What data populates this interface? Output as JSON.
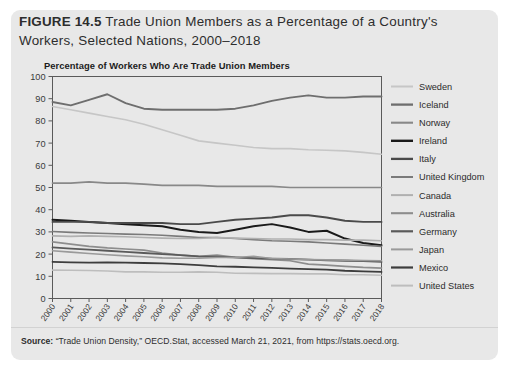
{
  "figure": {
    "number": "FIGURE 14.5",
    "title": "Trade Union Members as a Percentage of a Country's Workers, Selected Nations, 2000–2018",
    "subtitle": "Percentage of Workers Who Are Trade Union Members",
    "source_label": "Source:",
    "source_text": " “Trade Union Density,” OECD.Stat, accessed March 21, 2021, from https://stats.oecd.org.",
    "panel_color": "#e8e8e8",
    "page_color": "#ffffff"
  },
  "chart_data": {
    "type": "line",
    "title": "Percentage of Workers Who Are Trade Union Members",
    "xlabel": "",
    "ylabel": "",
    "ylim": [
      0,
      100
    ],
    "ytick_step": 10,
    "grid": false,
    "legend_position": "right",
    "x": [
      2000,
      2001,
      2002,
      2003,
      2004,
      2005,
      2006,
      2007,
      2008,
      2009,
      2010,
      2011,
      2012,
      2013,
      2014,
      2015,
      2016,
      2017,
      2018
    ],
    "categories": [
      "2000",
      "2001",
      "2002",
      "2003",
      "2004",
      "2005",
      "2006",
      "2007",
      "2008",
      "2009",
      "2010",
      "2011",
      "2012",
      "2013",
      "2014",
      "2015",
      "2016",
      "2017",
      "2018"
    ],
    "yticks": [
      0,
      10,
      20,
      30,
      40,
      50,
      60,
      70,
      80,
      90,
      100
    ],
    "series": [
      {
        "name": "Sweden",
        "color": "#c6c6c6",
        "width": 1.6,
        "values": [
          86.5,
          85.0,
          83.5,
          82.0,
          80.5,
          78.5,
          76.0,
          73.5,
          71.0,
          70.0,
          69.0,
          68.0,
          67.5,
          67.5,
          67.0,
          66.8,
          66.5,
          65.8,
          65.0
        ]
      },
      {
        "name": "Iceland",
        "color": "#6e6e6e",
        "width": 1.9,
        "values": [
          88.5,
          87.0,
          89.5,
          92.0,
          88.0,
          85.5,
          85.0,
          85.0,
          85.0,
          85.0,
          85.5,
          87.0,
          89.0,
          90.5,
          91.5,
          90.5,
          90.5,
          91.0,
          91.0
        ]
      },
      {
        "name": "Norway",
        "color": "#888888",
        "width": 1.7,
        "values": [
          52.0,
          52.0,
          52.5,
          52.0,
          52.0,
          51.5,
          51.0,
          51.0,
          51.0,
          50.5,
          50.5,
          50.5,
          50.5,
          50.0,
          50.0,
          50.0,
          50.0,
          50.0,
          50.0
        ]
      },
      {
        "name": "Ireland",
        "color": "#1a1a1a",
        "width": 2.0,
        "values": [
          35.5,
          35.0,
          34.5,
          34.0,
          33.5,
          33.0,
          32.5,
          31.0,
          30.0,
          29.5,
          31.0,
          32.5,
          33.5,
          32.0,
          30.0,
          30.5,
          27.0,
          25.0,
          24.0
        ]
      },
      {
        "name": "Italy",
        "color": "#4a4a4a",
        "width": 1.9,
        "values": [
          34.5,
          34.5,
          34.5,
          34.0,
          34.0,
          34.0,
          34.0,
          33.5,
          33.5,
          34.5,
          35.5,
          36.0,
          36.5,
          37.5,
          37.5,
          36.5,
          35.0,
          34.5,
          34.5
        ]
      },
      {
        "name": "United Kingdom",
        "color": "#7a7a7a",
        "width": 1.6,
        "values": [
          30.2,
          29.8,
          29.5,
          29.3,
          29.0,
          28.8,
          28.5,
          28.0,
          27.5,
          27.5,
          27.0,
          26.5,
          26.0,
          25.8,
          25.5,
          25.0,
          24.5,
          24.0,
          23.5
        ]
      },
      {
        "name": "Canada",
        "color": "#b0b0b0",
        "width": 1.6,
        "values": [
          28.2,
          28.0,
          28.2,
          28.0,
          27.8,
          27.5,
          27.2,
          27.0,
          27.0,
          27.5,
          27.2,
          27.0,
          26.8,
          26.8,
          26.5,
          26.5,
          26.3,
          26.3,
          26.0
        ]
      },
      {
        "name": "Australia",
        "color": "#8d8d8d",
        "width": 1.7,
        "values": [
          25.5,
          24.5,
          23.5,
          22.8,
          22.3,
          21.8,
          20.5,
          19.5,
          19.0,
          19.5,
          18.5,
          18.0,
          17.5,
          17.0,
          15.5,
          15.0,
          14.5,
          14.0,
          13.7
        ]
      },
      {
        "name": "Germany",
        "color": "#5a5a5a",
        "width": 1.8,
        "values": [
          23.0,
          22.5,
          22.0,
          21.5,
          21.0,
          20.5,
          20.0,
          19.5,
          19.0,
          18.8,
          18.5,
          18.2,
          18.0,
          17.8,
          17.5,
          17.2,
          17.0,
          16.8,
          16.5
        ]
      },
      {
        "name": "Japan",
        "color": "#9a9a9a",
        "width": 1.6,
        "values": [
          21.5,
          20.9,
          20.3,
          19.7,
          19.2,
          18.8,
          18.3,
          18.1,
          18.2,
          18.5,
          18.5,
          19.0,
          18.0,
          17.8,
          17.6,
          17.4,
          17.3,
          17.1,
          17.0
        ]
      },
      {
        "name": "Mexico",
        "color": "#3d3d3d",
        "width": 1.8,
        "values": [
          16.5,
          16.3,
          16.2,
          16.3,
          16.2,
          16.0,
          15.8,
          15.5,
          15.0,
          14.5,
          14.3,
          14.0,
          13.8,
          13.5,
          13.2,
          13.0,
          12.5,
          12.2,
          12.0
        ]
      },
      {
        "name": "United States",
        "color": "#bdbdbd",
        "width": 1.6,
        "values": [
          12.8,
          12.7,
          12.6,
          12.4,
          12.0,
          12.0,
          11.8,
          11.8,
          12.0,
          11.8,
          11.4,
          11.3,
          11.2,
          11.2,
          11.1,
          11.1,
          10.7,
          10.7,
          10.5
        ]
      }
    ]
  }
}
